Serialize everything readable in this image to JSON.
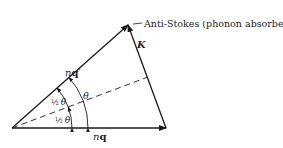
{
  "diagram": {
    "title_label": "Anti-Stokes (phonon absorbed)",
    "vectors": {
      "incident": {
        "label_n": "n",
        "label_q": "q"
      },
      "scattered": {
        "label_n": "n",
        "label_q": "q",
        "prime": "′"
      },
      "phonon": {
        "label": "K"
      }
    },
    "angles": {
      "full": "θ",
      "half_upper_frac": "½",
      "half_upper_sym": "θ",
      "half_lower_frac": "½",
      "half_lower_sym": "θ"
    },
    "colors": {
      "line": "#1a1a1a",
      "text": "#222222",
      "background": "#ffffff"
    }
  }
}
